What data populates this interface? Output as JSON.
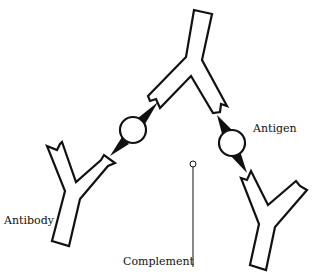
{
  "diagram": {
    "labels": {
      "antigen": "Antigen",
      "antibody": "Antibody",
      "complement": "Complement"
    },
    "colors": {
      "stroke": "#111111",
      "fill": "#ffffff",
      "background": "#ffffff"
    },
    "elements": [
      {
        "type": "antibody",
        "position": "top-center"
      },
      {
        "type": "antibody",
        "position": "lower-left"
      },
      {
        "type": "antibody",
        "position": "lower-right"
      },
      {
        "type": "antigen",
        "position": "left-bridge"
      },
      {
        "type": "antigen",
        "position": "right-bridge"
      },
      {
        "type": "complement",
        "position": "center"
      }
    ]
  }
}
